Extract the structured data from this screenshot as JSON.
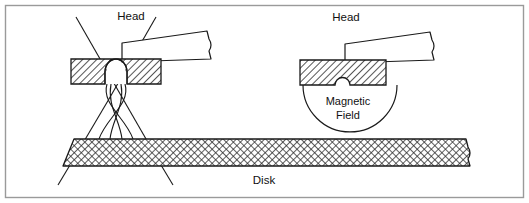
{
  "figure": {
    "background_color": "#ffffff",
    "border_color": "#9a9a9a",
    "line_color": "#1a1a1a",
    "hatch_color": "#2a2a2a",
    "text_color": "#111111"
  },
  "labels": {
    "head_left": "Head",
    "head_right": "Head",
    "magnetic_field_line1": "Magnetic",
    "magnetic_field_line2": "Field",
    "disk": "Disk"
  },
  "panels": {
    "left": {
      "name": "wide-gap-head-panel",
      "head_label": "Head",
      "gap_shape": "tall-dome",
      "field_pattern": "crossed-flux-lines"
    },
    "right": {
      "name": "narrow-gap-head-panel",
      "head_label": "Head",
      "gap_shape": "small-semicircle",
      "field_pattern": "semicircular-arc",
      "field_label_line1": "Magnetic",
      "field_label_line2": "Field"
    }
  },
  "components": {
    "head_core": "hatched-rectangle",
    "suspension_arm": "tapered-arm-with-break",
    "disk_medium": "cross-hatched-slab",
    "flux_line": "magnetic-flux-line"
  }
}
